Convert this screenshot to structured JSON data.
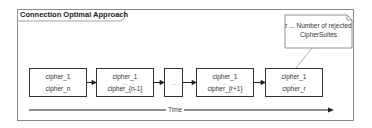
{
  "frame": {
    "title": "Connection Optimal Approach"
  },
  "note": {
    "line1": "r ... Number of rejected",
    "line2": "CipherSuites"
  },
  "boxes": [
    {
      "top": "cipher_1",
      "mid": "...",
      "bottom": "cipher_n"
    },
    {
      "top": "cipher_1",
      "mid": "...",
      "bottom": "cipher_{n-1}"
    },
    {
      "top": "",
      "mid": "...",
      "bottom": ""
    },
    {
      "top": "cipher_1",
      "mid": "...",
      "bottom": "cipher_{r+1}"
    },
    {
      "top": "cipher_1",
      "mid": "...",
      "bottom": "cipher_r"
    }
  ],
  "axis": {
    "label": "Time"
  },
  "colors": {
    "stroke": "#333333",
    "frame": "#8a8a8a",
    "background": "#ffffff"
  }
}
